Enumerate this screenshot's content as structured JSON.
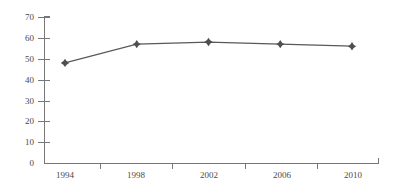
{
  "chart_data": {
    "type": "line",
    "title": "",
    "xlabel": "",
    "ylabel": "",
    "categories": [
      "1994",
      "1998",
      "2002",
      "2006",
      "2010"
    ],
    "values": [
      48,
      57,
      58,
      57,
      56
    ],
    "series": [
      {
        "name": "series-1",
        "values": [
          48,
          57,
          58,
          57,
          56
        ]
      }
    ],
    "ylim": [
      0,
      70
    ],
    "ytick_step": 10,
    "yticks": [
      "70",
      "60",
      "50",
      "40",
      "30",
      "20",
      "10",
      "0"
    ],
    "xlim": [
      "1994",
      "2010"
    ],
    "grid": false,
    "legend": false,
    "legend_position": "none",
    "marker": "diamond",
    "colors": {
      "line": "#595959",
      "marker": "#4f4f4f",
      "axis": "#767676",
      "text": "#4a4a4a",
      "background": "#ffffff"
    }
  }
}
